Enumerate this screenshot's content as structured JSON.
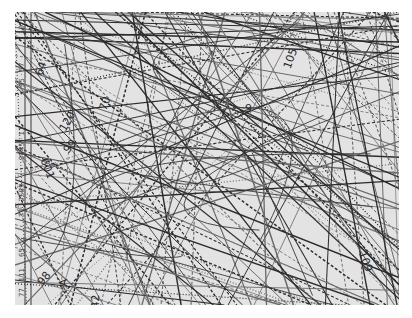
{
  "map": {
    "background": "#e3e3e3",
    "line_color": "#2b2b2b",
    "margin_labels": [
      {
        "text": "10",
        "x": 3,
        "y": 22
      },
      {
        "text": "95 · 57",
        "x": 3,
        "y": 75
      },
      {
        "text": "2445 · 11",
        "x": 3,
        "y": 148
      },
      {
        "text": "71 · 2585",
        "x": 3,
        "y": 205
      },
      {
        "text": "65",
        "x": 3,
        "y": 245
      },
      {
        "text": "77 · 111",
        "x": 3,
        "y": 285
      }
    ],
    "labels": [
      {
        "text": "64",
        "x": 19,
        "y": 50,
        "rot": -70
      },
      {
        "text": "70",
        "x": 83,
        "y": 85,
        "rot": -70
      },
      {
        "text": "120",
        "x": 42,
        "y": 103,
        "rot": -60
      },
      {
        "text": "99",
        "x": 48,
        "y": 128,
        "rot": -50
      },
      {
        "text": "601",
        "x": 22,
        "y": 150,
        "rot": 70
      },
      {
        "text": "98",
        "x": 22,
        "y": 260,
        "rot": -50
      },
      {
        "text": "A",
        "x": 45,
        "y": 264,
        "rot": -90
      },
      {
        "text": "42",
        "x": 73,
        "y": 283,
        "rot": -90
      },
      {
        "text": "109",
        "x": 340,
        "y": 243,
        "rot": 70
      },
      {
        "text": "105",
        "x": 265,
        "y": 40,
        "rot": -70
      },
      {
        "text": "9",
        "x": 230,
        "y": 90,
        "rot": 0
      }
    ]
  }
}
